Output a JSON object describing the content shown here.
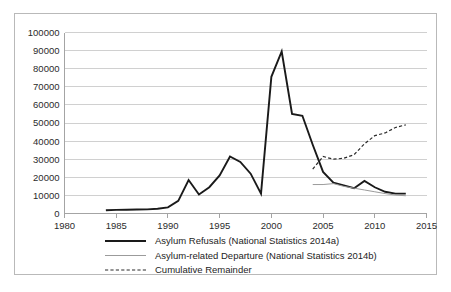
{
  "chart_data": {
    "type": "line",
    "title": "",
    "subtitle": "",
    "xlabel": "",
    "ylabel": "",
    "xlim": [
      1980,
      2015
    ],
    "ylim": [
      0,
      100000
    ],
    "grid": true,
    "legend_position": "bottom",
    "y_ticks": [
      "0",
      "10000",
      "20000",
      "30000",
      "40000",
      "50000",
      "60000",
      "70000",
      "80000",
      "90000",
      "100000"
    ],
    "y_tick_values": [
      0,
      10000,
      20000,
      30000,
      40000,
      50000,
      60000,
      70000,
      80000,
      90000,
      100000
    ],
    "x_ticks": [
      "1980",
      "1985",
      "1990",
      "1995",
      "2000",
      "2005",
      "2010",
      "2015"
    ],
    "x_tick_values": [
      1980,
      1985,
      1990,
      1995,
      2000,
      2005,
      2010,
      2015
    ],
    "series": [
      {
        "name": "Asylum Refusals (National Statistics 2014a)",
        "style": "solid-thick",
        "color": "#1a1a1a",
        "width": 1.9,
        "x": [
          1984,
          1985,
          1986,
          1987,
          1988,
          1989,
          1990,
          1991,
          1992,
          1993,
          1994,
          1995,
          1996,
          1997,
          1998,
          1999,
          2000,
          2001,
          2002,
          2003,
          2004,
          2005,
          2006,
          2007,
          2008,
          2009,
          2010,
          2011,
          2012,
          2013
        ],
        "values": [
          1800,
          2000,
          2100,
          2200,
          2300,
          2600,
          3400,
          7000,
          18500,
          10500,
          14500,
          21000,
          31500,
          28500,
          22000,
          11000,
          75500,
          89500,
          55000,
          54000,
          38000,
          23000,
          17000,
          15500,
          14000,
          18000,
          14500,
          12000,
          11000,
          11000
        ]
      },
      {
        "name": "Asylum-related Departure (National Statistics 2014b)",
        "style": "solid-thin",
        "color": "#9b9b9b",
        "width": 1.0,
        "x": [
          2004,
          2005,
          2006,
          2007,
          2008,
          2009,
          2010,
          2011,
          2012,
          2013
        ],
        "values": [
          16000,
          16000,
          16500,
          15000,
          14000,
          13000,
          12000,
          11000,
          10200,
          9800
        ]
      },
      {
        "name": "Cumulative Remainder",
        "style": "dashed",
        "color": "#2b2b2b",
        "width": 1.2,
        "x": [
          2004,
          2005,
          2006,
          2007,
          2008,
          2009,
          2010,
          2011,
          2012,
          2013
        ],
        "values": [
          24500,
          31500,
          30000,
          30500,
          32500,
          38500,
          43000,
          44500,
          47500,
          49000
        ]
      }
    ]
  },
  "legend": {
    "items": [
      {
        "label": "Asylum Refusals (National Statistics 2014a)",
        "style": "solid-thick",
        "color": "#1a1a1a"
      },
      {
        "label": "Asylum-related Departure (National Statistics 2014b)",
        "style": "solid-thin",
        "color": "#9b9b9b"
      },
      {
        "label": "Cumulative Remainder",
        "style": "dashed",
        "color": "#2b2b2b"
      }
    ]
  }
}
